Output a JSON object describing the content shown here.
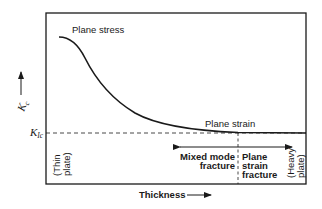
{
  "diagram": {
    "type": "fracture-toughness-vs-thickness",
    "y_axis": {
      "label": "K",
      "label_subscript": "c",
      "arrow": "up"
    },
    "x_axis": {
      "label": "Thickness",
      "arrow": "right"
    },
    "reference_line": {
      "label": "K",
      "label_subscript": "Ic",
      "style": "dashed"
    },
    "curve_labels": {
      "plane_stress": "Plane stress",
      "plane_strain": "Plane strain"
    },
    "regions": {
      "left_end": [
        "(Thin",
        "plate)"
      ],
      "right_end": [
        "(Heavy",
        "plate)"
      ],
      "mixed_mode": [
        "Mixed mode",
        "fracture"
      ],
      "plane_strain_fracture": [
        "Plane",
        "strain",
        "fracture"
      ]
    },
    "colors": {
      "ink": "#1a1a1a",
      "background": "#ffffff"
    }
  }
}
